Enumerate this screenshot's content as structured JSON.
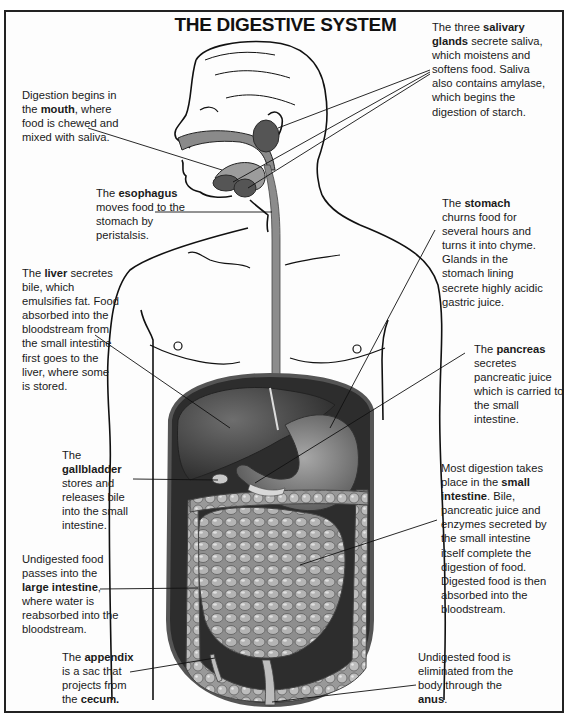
{
  "title": "THE DIGESTIVE SYSTEM",
  "colors": {
    "border": "#222222",
    "organ_dark": "#3a3a3a",
    "organ_mid": "#7a7a7a",
    "organ_light": "#b5b5b5",
    "esophagus": "#8c8c8c",
    "outline": "#111111"
  },
  "labels": {
    "mouth": {
      "pre": "Digestion begins in the ",
      "bold": "mouth",
      "post": ", where food is chewed and mixed with saliva."
    },
    "salivary": {
      "pre": "The three ",
      "bold": "salivary glands",
      "post": " secrete saliva, which moistens and softens food. Saliva also contains amylase, which begins the digestion of starch."
    },
    "esophagus": {
      "pre": "The ",
      "bold": "esophagus",
      "post": " moves food to the stomach by peristalsis."
    },
    "stomach": {
      "pre": "The ",
      "bold": "stomach",
      "post": " churns food for several hours and turns it into chyme. Glands in the stomach lining secrete highly acidic gastric juice."
    },
    "liver": {
      "pre": "The ",
      "bold": "liver",
      "post": " secretes bile, which emulsifies fat. Food absorbed into the bloodstream from the small intestine first goes to the liver, where some is stored."
    },
    "pancreas": {
      "pre": "The ",
      "bold": "pancreas",
      "post": " secretes pancreatic juice which is carried to the small intestine."
    },
    "gallbladder": {
      "pre": "The ",
      "bold": "gallbladder",
      "post": " stores and releases bile into the small intestine."
    },
    "small_intestine": {
      "pre": "Most digestion takes place in the ",
      "bold": "small intestine",
      "post": ". Bile, pancreatic juice and enzymes secreted by the small intestine itself complete the digestion of food. Digested food is then absorbed into the bloodstream."
    },
    "large_intestine": {
      "pre": "Undigested food passes into the ",
      "bold": "large intestine",
      "post": ", where water is reabsorbed into the bloodstream."
    },
    "appendix": {
      "pre": "The ",
      "bold": "appendix",
      "mid": " is a sac that projects from the ",
      "bold2": "cecum."
    },
    "anus": {
      "pre": "Undigested food is eliminated from the body through the ",
      "bold": "anus",
      "post": "."
    }
  }
}
